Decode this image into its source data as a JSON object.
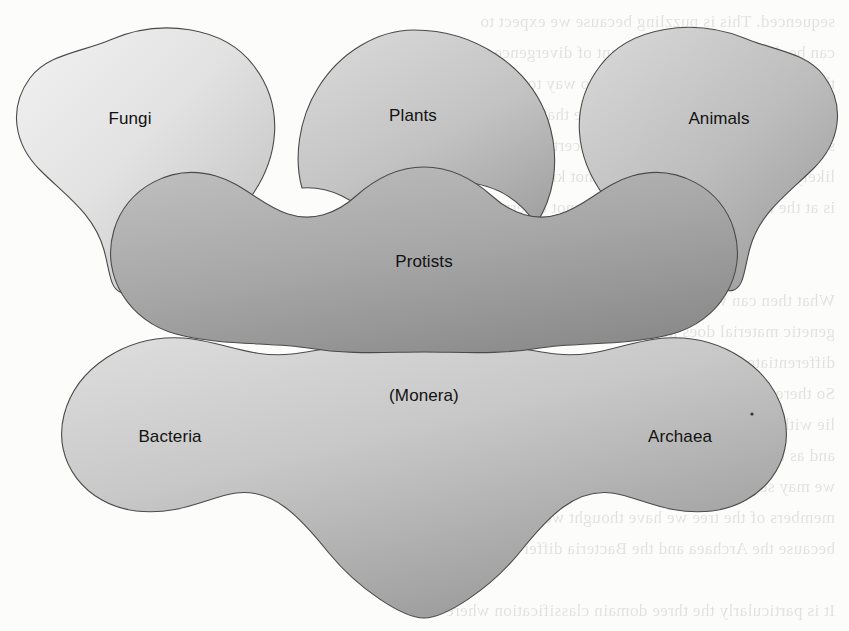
{
  "figure": {
    "background_color": "#fcfcfb",
    "outline_color": "#3a3a3a",
    "label_color": "#121212",
    "bleed_through_text": "sequenced. This is puzzling because we expect to\ncan be determined by the amount of divergence. When the\nthe very beginning, then there is no way to use these methods\nthe organisms. This problem may be that the shapes are\nseparated, and we cannot know for certain how they place\nlikely that this is unlikely. We do not know how the tree\nis at the base of the tree, and we cannot determine it.\n\n\nWhat then can we\ngenetic material does not agree that the archaea are not a\ndifferentiate the genes between the Bacteria and the Eukarya\nSo there may yet be many things about Archaea we do not\nlie within the Bacteria is considered as the standard of\nand as the genomes are more completely sequenced\nwe may see the overall picture change. Some might be\nmembers of the tree we have thought were Bacteria\nbecause the Archaea and the Bacteria differ\n\nIt is particularly the three domain classification where"
  },
  "groups": [
    {
      "id": "fungi",
      "label": "Fungi",
      "label_x": 130,
      "label_y": 120,
      "fill_light": "#ededed",
      "fill_dark": "#b9b9b9"
    },
    {
      "id": "plants",
      "label": "Plants",
      "label_x": 413,
      "label_y": 117,
      "fill_light": "#d2d2d2",
      "fill_dark": "#a6a6a6"
    },
    {
      "id": "animals",
      "label": "Animals",
      "label_x": 719,
      "label_y": 120,
      "fill_light": "#cecece",
      "fill_dark": "#9c9c9c"
    },
    {
      "id": "protists",
      "label": "Protists",
      "label_x": 424,
      "label_y": 263,
      "fill_light": "#b4b4b4",
      "fill_dark": "#848484"
    },
    {
      "id": "monera",
      "label": "(Monera)",
      "label_x": 424,
      "label_y": 397,
      "fill_light": "#d4d4d4",
      "fill_dark": "#9d9d9d"
    },
    {
      "id": "bacteria",
      "label": "Bacteria",
      "label_x": 170,
      "label_y": 438,
      "fill_light": "",
      "fill_dark": ""
    },
    {
      "id": "archaea",
      "label": "Archaea",
      "label_x": 680,
      "label_y": 438,
      "fill_light": "",
      "fill_dark": ""
    }
  ]
}
